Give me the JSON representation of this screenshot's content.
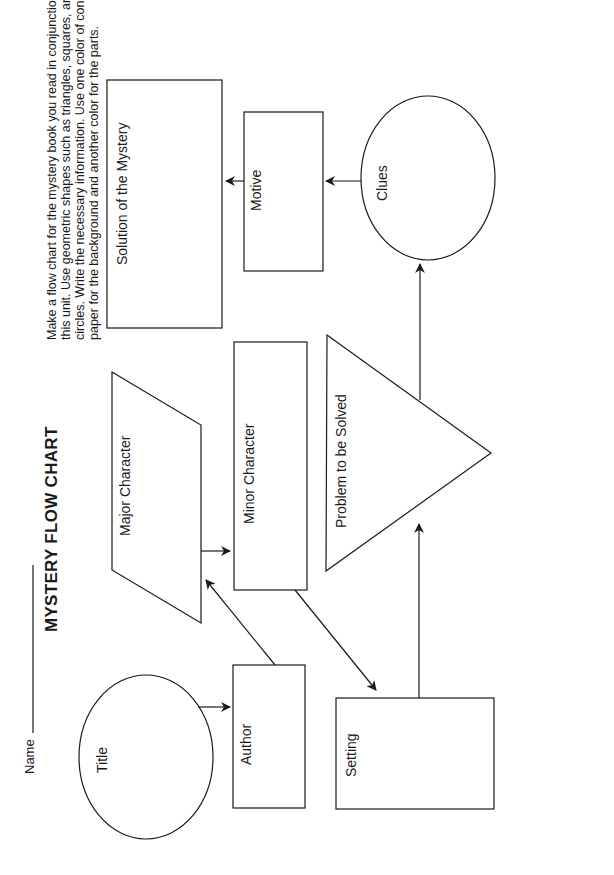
{
  "header": {
    "name_label": "Name",
    "title": "MYSTERY FLOW CHART",
    "instructions": [
      "Make a flow chart for the mystery book you read in conjunction with",
      "this unit. Use geometric shapes such as triangles, squares, and",
      "circles. Write the necessary information. Use one color of construction",
      "paper for the background and another color for the parts."
    ]
  },
  "flowchart": {
    "nodes": {
      "title": "Title",
      "author": "Author",
      "major_character": "Major Character",
      "minor_character": "Minor Character",
      "setting": "Setting",
      "problem": "Problem to be Solved",
      "clues": "Clues",
      "motive": "Motive",
      "solution": "Solution of the Mystery"
    },
    "edges": [
      [
        "Title",
        "Author"
      ],
      [
        "Author",
        "Major Character"
      ],
      [
        "Major Character",
        "Minor Character"
      ],
      [
        "Minor Character",
        "Setting"
      ],
      [
        "Setting",
        "Problem to be Solved"
      ],
      [
        "Problem to be Solved",
        "Clues"
      ],
      [
        "Clues",
        "Motive"
      ],
      [
        "Motive",
        "Solution of the Mystery"
      ]
    ]
  }
}
